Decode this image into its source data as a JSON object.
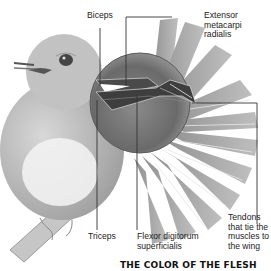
{
  "diagram": {
    "labels": {
      "biceps": "Biceps",
      "extensor": "Extensor\nmetacarpi\nradialis",
      "triceps": "Triceps",
      "flexor": "Flexor digitorum\nsuperficialis",
      "tendons": "Tendons\nthat tie the\nmuscles to\nthe wing"
    },
    "heading": "THE COLOR OF THE FLESH",
    "colors": {
      "ink": "#222222",
      "leader": "#333333",
      "feather": "#9a9a9a",
      "magnifier": "#6e6e6e",
      "bird": "#b9b9b9"
    }
  }
}
